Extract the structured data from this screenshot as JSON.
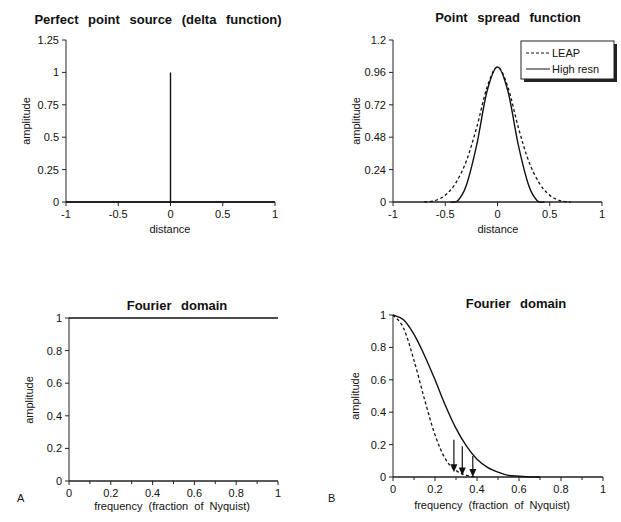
{
  "chart_data": [
    {
      "id": "A-top",
      "type": "line",
      "title": "Perfect point source (delta function)",
      "xlabel": "distance",
      "ylabel": "amplitude",
      "xlim": [
        -1,
        1
      ],
      "ylim": [
        0,
        1.25
      ],
      "xticks": [
        "-1",
        "-0.5",
        "0",
        "0.5",
        "1"
      ],
      "yticks": [
        "0",
        "0.25",
        "0.5",
        "0.75",
        "1",
        "1.25"
      ],
      "grid": false,
      "series": [
        {
          "name": "delta",
          "style": "solid",
          "x": [
            -1,
            0,
            0,
            0,
            1
          ],
          "y": [
            0,
            0,
            1,
            0,
            0
          ]
        }
      ]
    },
    {
      "id": "B-top",
      "type": "line",
      "title": "Point spread function",
      "xlabel": "distance",
      "ylabel": "amplitude",
      "xlim": [
        -1,
        1
      ],
      "ylim": [
        0,
        1.2
      ],
      "xticks": [
        "-1",
        "-0.5",
        "0",
        "0.5",
        "1"
      ],
      "yticks": [
        "0",
        "0.24",
        "0.48",
        "0.72",
        "0.96",
        "1.2"
      ],
      "grid": false,
      "legend": {
        "position": "upper right",
        "entries": [
          "LEAP",
          "High resn"
        ]
      },
      "series": [
        {
          "name": "LEAP",
          "style": "dashed",
          "x": [
            -0.7,
            -0.6,
            -0.5,
            -0.4,
            -0.3,
            -0.2,
            -0.1,
            0,
            0.1,
            0.2,
            0.3,
            0.4,
            0.5,
            0.6,
            0.7
          ],
          "y": [
            0,
            0.01,
            0.05,
            0.14,
            0.3,
            0.55,
            0.85,
            1.0,
            0.85,
            0.55,
            0.3,
            0.14,
            0.05,
            0.01,
            0
          ]
        },
        {
          "name": "High resn",
          "style": "solid",
          "x": [
            -0.45,
            -0.38,
            -0.3,
            -0.2,
            -0.1,
            0,
            0.1,
            0.2,
            0.3,
            0.38,
            0.45
          ],
          "y": [
            0,
            0.01,
            0.12,
            0.42,
            0.82,
            1.0,
            0.82,
            0.42,
            0.12,
            0.01,
            0
          ]
        }
      ]
    },
    {
      "id": "A-bottom",
      "type": "line",
      "title": "Fourier domain",
      "xlabel": "frequency (fraction of Nyquist)",
      "ylabel": "amplitude",
      "xlim": [
        0,
        1
      ],
      "ylim": [
        0,
        1
      ],
      "xticks": [
        "0",
        "0.2",
        "0.4",
        "0.6",
        "0.8",
        "1"
      ],
      "yticks": [
        "0",
        "0.2",
        "0.4",
        "0.6",
        "0.8",
        "1"
      ],
      "grid": false,
      "series": [
        {
          "name": "flat",
          "style": "solid",
          "x": [
            0,
            1
          ],
          "y": [
            1,
            1
          ]
        }
      ]
    },
    {
      "id": "B-bottom",
      "type": "line",
      "title": "Fourier domain",
      "xlabel": "frequency (fraction of Nyquist)",
      "ylabel": "amplitude",
      "xlim": [
        0,
        1
      ],
      "ylim": [
        0,
        1
      ],
      "xticks": [
        "0",
        "0.2",
        "0.4",
        "0.6",
        "0.8",
        "1"
      ],
      "yticks": [
        "0",
        "0.2",
        "0.4",
        "0.6",
        "0.8",
        "1"
      ],
      "grid": false,
      "series": [
        {
          "name": "LEAP",
          "style": "dashed",
          "x": [
            0,
            0.05,
            0.1,
            0.15,
            0.2,
            0.25,
            0.3,
            0.35,
            0.4
          ],
          "y": [
            1,
            0.92,
            0.72,
            0.48,
            0.26,
            0.11,
            0.04,
            0.01,
            0
          ]
        },
        {
          "name": "High resn",
          "style": "solid",
          "x": [
            0,
            0.05,
            0.1,
            0.15,
            0.2,
            0.25,
            0.3,
            0.35,
            0.4,
            0.45,
            0.5,
            0.55,
            0.6,
            0.65,
            0.7
          ],
          "y": [
            1,
            0.97,
            0.88,
            0.75,
            0.6,
            0.44,
            0.3,
            0.19,
            0.11,
            0.06,
            0.03,
            0.01,
            0.005,
            0,
            0
          ]
        }
      ],
      "annotations": [
        {
          "type": "arrow",
          "x": 0.29,
          "y_from": 0.23,
          "y_to": 0.03
        },
        {
          "type": "arrow",
          "x": 0.33,
          "y_from": 0.19,
          "y_to": 0.01
        },
        {
          "type": "arrow",
          "x": 0.38,
          "y_from": 0.13,
          "y_to": 0
        }
      ]
    }
  ],
  "panel_labels": {
    "a": "A",
    "b": "B"
  }
}
